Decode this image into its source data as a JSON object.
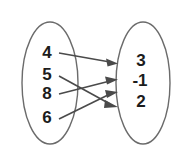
{
  "diagram": {
    "type": "mapping-diagram",
    "title": "",
    "domain_set": {
      "name": "domain-oval",
      "elements": [
        "4",
        "5",
        "8",
        "6"
      ]
    },
    "range_set": {
      "name": "range-oval",
      "elements": [
        "3",
        "-1",
        "2"
      ]
    },
    "mappings": [
      {
        "from": "4",
        "to": "3"
      },
      {
        "from": "5",
        "to": "2"
      },
      {
        "from": "8",
        "to": "-1"
      },
      {
        "from": "6",
        "to": "2"
      }
    ],
    "colors": {
      "oval_stroke": "#6b6b6b",
      "arrow_stroke": "#4a4a4a",
      "text": "#1c1c1c",
      "background": "#ffffff"
    }
  }
}
